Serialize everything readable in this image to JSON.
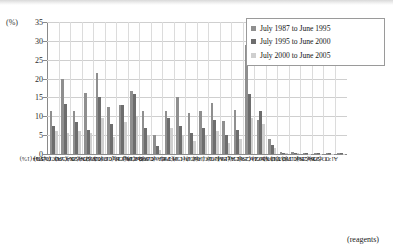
{
  "axis": {
    "unit_label": "(%)",
    "x_axis_note": "(reagents)",
    "y_ticks": [
      "0",
      "5",
      "10",
      "15",
      "20",
      "25",
      "30",
      "35"
    ]
  },
  "legend": {
    "items": [
      {
        "label": "July 1987 to June 1995",
        "color": "#8f8f8f"
      },
      {
        "label": "July 1995 to June 2000",
        "color": "#6d6d6d"
      },
      {
        "label": "July 2000 to June 2005",
        "color": "#cfcfcf"
      }
    ]
  },
  "chart_data": {
    "type": "bar",
    "title": "",
    "xlabel": "(reagents)",
    "ylabel": "(%)",
    "ylim": [
      0,
      35
    ],
    "grid": true,
    "legend_position": "top-right",
    "categories": [
      "CuSO4 (1%)",
      "PdCl2 (1%)",
      "K2Cr2O7 (0.5%)",
      "NiSO4 (5%)",
      "NiSO4 (2%)",
      "CoCl2 (2%)",
      "HgCl2 (0.1%)",
      "HgCl2 (0.05%)",
      "SnCl4 (1%)",
      "CdSO4 (1%)",
      "HAuCl4 (0.2%)",
      "H2PtCl6 (0.5%)",
      "FeCl3 (2%)",
      "InCl3 (1%)",
      "IrCl4 (1%)",
      "MoCl5 (1%)",
      "AgBr (2%)",
      "SbCl3 (1%)",
      "ZnCl2 (2%)",
      "MnCl2 (2%)",
      "TiO2 (30%)",
      "TiO2 (10%)",
      "BaCl2 (0.5%)",
      "BaCl2 (0.1%)",
      "CrSO4 (2%)",
      "Al2O3 (2%)"
    ],
    "series": [
      {
        "name": "July 1987 to June 1995",
        "color": "#8f8f8f",
        "values": [
          11.3,
          20.0,
          11.3,
          16.3,
          21.5,
          12.5,
          13.0,
          16.8,
          11.5,
          5.0,
          11.5,
          15.0,
          11.0,
          11.5,
          13.4,
          8.8,
          11.8,
          29.0,
          9.0,
          4.0,
          0.6,
          0.6,
          0.3,
          0.2,
          0.2,
          0.2
        ]
      },
      {
        "name": "July 1995 to June 2000",
        "color": "#6d6d6d",
        "values": [
          7.5,
          13.2,
          8.5,
          6.5,
          15.0,
          8.0,
          13.0,
          16.0,
          7.0,
          2.0,
          9.5,
          7.5,
          5.5,
          7.0,
          9.0,
          5.0,
          6.5,
          16.0,
          11.5,
          2.5,
          0.4,
          0.4,
          0.2,
          0.2,
          0.2,
          0.2
        ]
      },
      {
        "name": "July 2000 to June 2005",
        "color": "#cfcfcf",
        "values": [
          6.0,
          5.5,
          6.0,
          5.5,
          9.5,
          4.5,
          8.5,
          10.0,
          5.0,
          1.0,
          7.0,
          5.0,
          3.5,
          5.0,
          6.0,
          3.0,
          4.0,
          9.5,
          8.0,
          1.5,
          0.3,
          0.3,
          0.1,
          0.1,
          0.1,
          0.1
        ]
      }
    ]
  }
}
